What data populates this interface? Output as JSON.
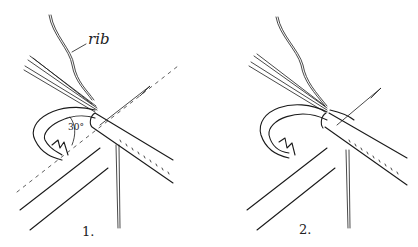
{
  "figure": {
    "panels": [
      {
        "id": 1,
        "caption": "1.",
        "annotations": {
          "rib_label": "rib",
          "angle_label": "30°"
        }
      },
      {
        "id": 2,
        "caption": "2."
      }
    ],
    "colors": {
      "ink": "#1a1a1a",
      "background": "#ffffff"
    }
  }
}
